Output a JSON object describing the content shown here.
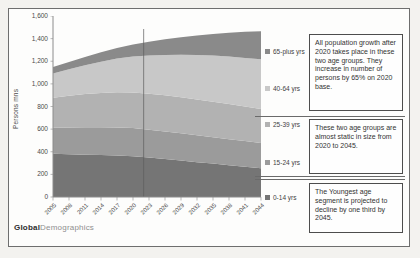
{
  "chart": {
    "y_axis_title": "Persons mns",
    "y_ticks": [
      "1,600",
      "1,400",
      "1,200",
      "1,000",
      "800",
      "600",
      "400",
      "200",
      "0"
    ],
    "x_ticks": [
      "2005",
      "2008",
      "2011",
      "2014",
      "2017",
      "2020",
      "2023",
      "2026",
      "2029",
      "2032",
      "2035",
      "2038",
      "2041",
      "2044"
    ],
    "legend": [
      {
        "label": "65-plus yrs",
        "color": "#8a8a8a"
      },
      {
        "label": "40-64 yrs",
        "color": "#c8c8c8"
      },
      {
        "label": "25-39 yrs",
        "color": "#b2b2b2"
      },
      {
        "label": "15-24 yrs",
        "color": "#9b9b9b"
      },
      {
        "label": "0-14 yrs",
        "color": "#757575"
      }
    ]
  },
  "chart_data": {
    "type": "area",
    "stacked": true,
    "title": "",
    "xlabel": "",
    "ylabel": "Persons mns",
    "ylim": [
      0,
      1600
    ],
    "grid": false,
    "legend_position": "right",
    "marker_line_year": 2022,
    "x": [
      2005,
      2008,
      2011,
      2014,
      2017,
      2020,
      2023,
      2026,
      2029,
      2032,
      2035,
      2038,
      2041,
      2044
    ],
    "series": [
      {
        "name": "0-14 yrs",
        "color": "#757575",
        "values": [
          382,
          378,
          374,
          370,
          366,
          360,
          348,
          335,
          322,
          308,
          295,
          281,
          268,
          255
        ]
      },
      {
        "name": "15-24 yrs",
        "color": "#9b9b9b",
        "values": [
          230,
          237,
          243,
          247,
          249,
          249,
          247,
          245,
          242,
          238,
          234,
          230,
          226,
          222
        ]
      },
      {
        "name": "25-39 yrs",
        "color": "#b2b2b2",
        "values": [
          266,
          280,
          293,
          303,
          311,
          316,
          318,
          319,
          318,
          316,
          313,
          310,
          306,
          302
        ]
      },
      {
        "name": "40-64 yrs",
        "color": "#c8c8c8",
        "values": [
          214,
          234,
          255,
          276,
          297,
          317,
          337,
          357,
          376,
          393,
          408,
          420,
          430,
          438
        ]
      },
      {
        "name": "65-plus yrs",
        "color": "#8a8a8a",
        "values": [
          56,
          64,
          73,
          83,
          94,
          107,
          122,
          138,
          155,
          173,
          192,
          211,
          230,
          248
        ]
      }
    ]
  },
  "annotations": [
    {
      "text": "All population growth after 2020 takes place in these two age groups. They increase in number of persons by 65% on 2020 base."
    },
    {
      "text": "These two age groups are almost static in size from 2020 to 2045."
    },
    {
      "text": "The Youngest age segment is projected to decline by one third by 2045."
    }
  ],
  "logo": {
    "bold": "Global",
    "light": "Demographics"
  }
}
